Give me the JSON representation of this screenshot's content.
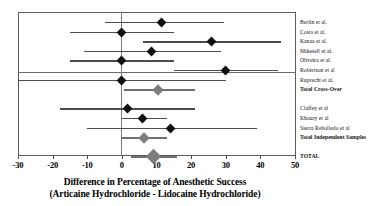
{
  "chart_data": {
    "type": "scatter",
    "plot_kind": "forest-plot",
    "title": "",
    "xlabel": "Difference in Percentage of Anesthetic Success (Articaine Hydrochloride - Lidocaine Hydrochloride)",
    "xlabel_line1": "Difference in Percentage of Anesthetic Success",
    "xlabel_line2": "(Articaine Hydrochloride - Lidocaine Hydrochloride)",
    "ylabel": "",
    "xlim": [
      -30,
      50
    ],
    "xticks": [
      -30,
      -20,
      -10,
      0,
      10,
      20,
      30,
      40,
      50
    ],
    "xtick_labels": [
      "-30",
      "-20",
      "-10",
      "0",
      "10",
      "20",
      "30",
      "40",
      "50"
    ],
    "grid": false,
    "legend": "none",
    "reference_line": 0,
    "marker_color": "#111111",
    "summary_color": "#7d7d7d",
    "line_color": "#4c4c4c",
    "groups": [
      {
        "name": "Cross-Over",
        "rows": [
          {
            "label": "Berlin et al.",
            "effect": 11.5,
            "ci_low": -5.0,
            "ci_high": 29.5,
            "summary": false
          },
          {
            "label": "Costa et al.",
            "effect": 0.0,
            "ci_low": -15.0,
            "ci_high": 15.0,
            "summary": false
          },
          {
            "label": "Kanaa et al.",
            "effect": 26.0,
            "ci_low": 6.0,
            "ci_high": 46.0,
            "summary": false
          },
          {
            "label": "Mikesell et al.",
            "effect": 8.5,
            "ci_low": -11.0,
            "ci_high": 28.5,
            "summary": false
          },
          {
            "label": "Oliveira et al.",
            "effect": 0.0,
            "ci_low": -15.0,
            "ci_high": 15.0,
            "summary": false
          },
          {
            "label": "Robertson et al",
            "effect": 30.0,
            "ci_low": 15.0,
            "ci_high": 45.0,
            "summary": false
          },
          {
            "label": "Ruprecht et al.",
            "effect": 0.0,
            "ci_low": -30.0,
            "ci_high": 30.0,
            "summary": false
          },
          {
            "label": "Total Cross-Over",
            "effect": 10.5,
            "ci_low": 0.5,
            "ci_high": 21.0,
            "summary": true
          }
        ]
      },
      {
        "name": "Independent Samples",
        "rows": [
          {
            "label": "Claffey et al",
            "effect": 1.5,
            "ci_low": -18.0,
            "ci_high": 21.0,
            "summary": false
          },
          {
            "label": "Khoury et al",
            "effect": 6.0,
            "ci_low": 0.0,
            "ci_high": 13.0,
            "summary": false
          },
          {
            "label": "Sierra Rebolledo et al",
            "effect": 14.0,
            "ci_low": -10.0,
            "ci_high": 39.0,
            "summary": false
          },
          {
            "label": "Total Independent Samples",
            "effect": 6.5,
            "ci_low": 0.0,
            "ci_high": 13.0,
            "summary": true
          }
        ]
      },
      {
        "name": "Overall",
        "rows": [
          {
            "label": "TOTAL",
            "effect": 9.0,
            "ci_low": 2.5,
            "ci_high": 16.0,
            "summary": true
          }
        ]
      }
    ]
  }
}
